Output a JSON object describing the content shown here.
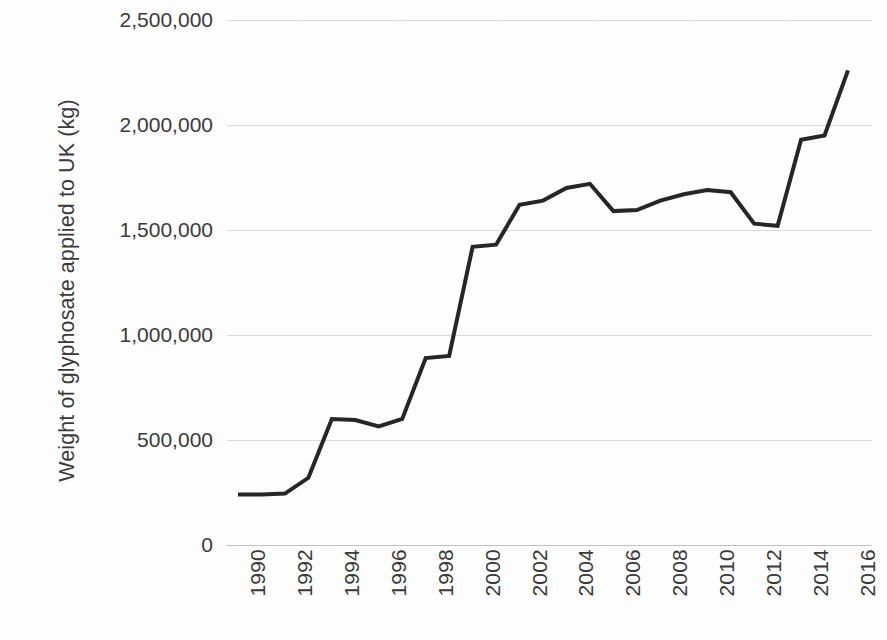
{
  "chart_data": {
    "type": "line",
    "title": "",
    "subtitle": "",
    "xlabel": "",
    "ylabel": "Weight of glyphosate applied to UK (kg)",
    "x": [
      1990,
      1991,
      1992,
      1993,
      1994,
      1995,
      1996,
      1997,
      1998,
      1999,
      2000,
      2001,
      2002,
      2003,
      2004,
      2005,
      2006,
      2007,
      2008,
      2009,
      2010,
      2011,
      2012,
      2013,
      2014,
      2015,
      2016
    ],
    "values": [
      240000,
      240000,
      245000,
      320000,
      600000,
      595000,
      565000,
      600000,
      890000,
      900000,
      1420000,
      1430000,
      1620000,
      1640000,
      1700000,
      1720000,
      1590000,
      1595000,
      1640000,
      1670000,
      1690000,
      1680000,
      1530000,
      1520000,
      1930000,
      1950000,
      2260000
    ],
    "series": [
      {
        "name": "Weight of glyphosate applied to UK (kg)",
        "color": "#262626",
        "values": [
          240000,
          240000,
          245000,
          320000,
          600000,
          595000,
          565000,
          600000,
          890000,
          900000,
          1420000,
          1430000,
          1620000,
          1640000,
          1700000,
          1720000,
          1590000,
          1595000,
          1640000,
          1670000,
          1690000,
          1680000,
          1530000,
          1520000,
          1930000,
          1950000,
          2260000
        ]
      }
    ],
    "xlim": [
      1990,
      2016
    ],
    "ylim": [
      0,
      2500000
    ],
    "y_ticks": [
      0,
      500000,
      1000000,
      1500000,
      2000000,
      2500000
    ],
    "y_tick_labels": [
      "0",
      "500,000",
      "1,000,000",
      "1,500,000",
      "2,000,000",
      "2,500,000"
    ],
    "x_ticks": [
      1990,
      1992,
      1994,
      1996,
      1998,
      2000,
      2002,
      2004,
      2006,
      2008,
      2010,
      2012,
      2014,
      2016
    ],
    "x_tick_labels": [
      "1990",
      "1992",
      "1994",
      "1996",
      "1998",
      "2000",
      "2002",
      "2004",
      "2006",
      "2008",
      "2010",
      "2012",
      "2014",
      "2016"
    ],
    "x_tick_rotation": -90,
    "grid": {
      "horizontal": true,
      "vertical": false,
      "color": "#d9d9d9"
    },
    "legend": {
      "visible": false,
      "position": "none"
    },
    "line_width": 4,
    "markers": false,
    "background": "#fdfdfd",
    "text_color": "#3a3a3a"
  }
}
